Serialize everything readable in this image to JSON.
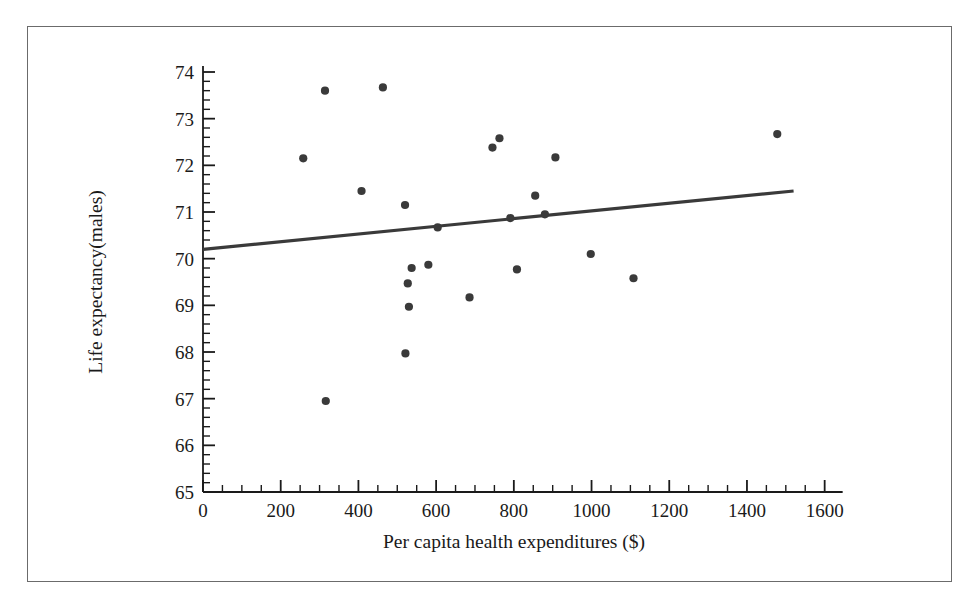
{
  "chart_data": {
    "type": "scatter",
    "title": "",
    "xlabel": "Per capita health expenditures ($)",
    "ylabel": "Life expectancy(males)",
    "xlim": [
      0,
      1600
    ],
    "ylim": [
      65,
      74
    ],
    "xticks": [
      0,
      200,
      400,
      600,
      800,
      1000,
      1200,
      1400,
      1600
    ],
    "xtick_labels": [
      "0",
      "200",
      "400",
      "600",
      "800",
      "1000",
      "1200",
      "1400",
      "1600"
    ],
    "yticks": [
      65,
      66,
      67,
      68,
      69,
      70,
      71,
      72,
      73,
      74
    ],
    "ytick_labels": [
      "65",
      "66",
      "67",
      "68",
      "69",
      "70",
      "71",
      "72",
      "73",
      "74"
    ],
    "x_minor_tick_step": 50,
    "y_minor_tick_step": 0.2,
    "grid": false,
    "legend": null,
    "marker_color": "#3a3a3a",
    "marker_size": 6,
    "line_color": "#3a3a3a",
    "axis_color": "#1a1a1a",
    "points": [
      {
        "x": 258,
        "y": 72.15
      },
      {
        "x": 314,
        "y": 73.6
      },
      {
        "x": 316,
        "y": 66.95
      },
      {
        "x": 408,
        "y": 71.45
      },
      {
        "x": 463,
        "y": 73.67
      },
      {
        "x": 520,
        "y": 71.15
      },
      {
        "x": 521,
        "y": 67.97
      },
      {
        "x": 527,
        "y": 69.47
      },
      {
        "x": 530,
        "y": 68.97
      },
      {
        "x": 537,
        "y": 69.8
      },
      {
        "x": 580,
        "y": 69.87
      },
      {
        "x": 604,
        "y": 70.67
      },
      {
        "x": 686,
        "y": 69.17
      },
      {
        "x": 745,
        "y": 72.38
      },
      {
        "x": 763,
        "y": 72.58
      },
      {
        "x": 791,
        "y": 70.87
      },
      {
        "x": 808,
        "y": 69.77
      },
      {
        "x": 855,
        "y": 71.35
      },
      {
        "x": 880,
        "y": 70.95
      },
      {
        "x": 907,
        "y": 72.17
      },
      {
        "x": 998,
        "y": 70.1
      },
      {
        "x": 1108,
        "y": 69.58
      },
      {
        "x": 1478,
        "y": 72.67
      }
    ],
    "regression_line": {
      "x_start": 0,
      "y_start": 70.2,
      "x_end": 1520,
      "y_end": 71.45,
      "slope": 0.000822,
      "intercept": 70.2
    }
  }
}
